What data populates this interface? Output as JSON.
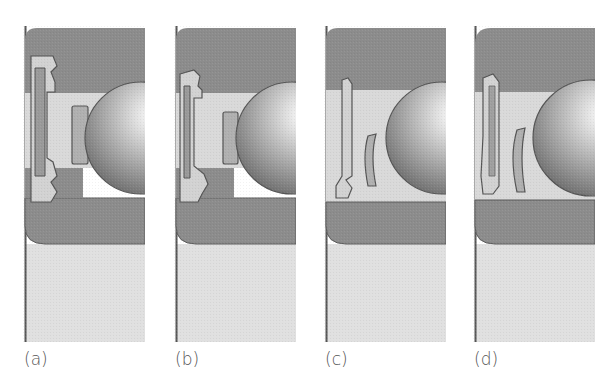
{
  "figure": {
    "panels": [
      {
        "id": "a",
        "label": "(a)",
        "seal_type": "double-lip contact seal"
      },
      {
        "id": "b",
        "label": "(b)",
        "seal_type": "multi-lip contact seal"
      },
      {
        "id": "c",
        "label": "(c)",
        "seal_type": "low-friction seal"
      },
      {
        "id": "d",
        "label": "(d)",
        "seal_type": "non-contact shield"
      }
    ]
  },
  "colors": {
    "ring": "#8c8c8c",
    "ring_edge": "#5a5a5a",
    "channel": "#d9d9d9",
    "shaft": "#e0e0e0",
    "seal_fill": "#c9c9c9",
    "seal_edge": "#555555",
    "ball_light": "#ffffff",
    "ball_dark": "#6e6e6e"
  }
}
